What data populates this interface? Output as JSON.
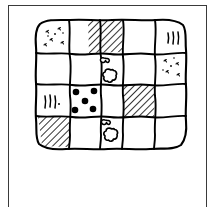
{
  "figure": {
    "title": "Patchwork quilt line drawing",
    "description": "Hand-drawn black ink outline of a square patchwork quilt divided into a 5 by 4 grid of patches, each patch drawn with wobbly freehand lines and filled with a different fabric pattern.",
    "style": "black-and-white line art",
    "stroke_color": "#000000",
    "background_color": "#ffffff",
    "frame": {
      "present": true,
      "shape": "rectangle",
      "color": "#3a3a3a",
      "line_width": 1
    }
  },
  "quilt": {
    "columns": 5,
    "rows": 4,
    "total_patches": 20,
    "patch_outline_color": "#000000",
    "patch_fill_color": "#ffffff",
    "patterns_legend": [
      {
        "key": "plain",
        "label": "plain"
      },
      {
        "key": "hatch",
        "label": "diagonal hatch"
      },
      {
        "key": "speckle",
        "label": "speckled"
      },
      {
        "key": "strokes",
        "label": "short strokes"
      },
      {
        "key": "dots",
        "label": "polka dots"
      },
      {
        "key": "flower",
        "label": "flower"
      }
    ],
    "patches": [
      {
        "row": 1,
        "col": 1,
        "pattern": "speckle"
      },
      {
        "row": 1,
        "col": 2,
        "pattern": "plain"
      },
      {
        "row": 1,
        "col": 3,
        "pattern": "hatch"
      },
      {
        "row": 1,
        "col": 4,
        "pattern": "plain"
      },
      {
        "row": 1,
        "col": 5,
        "pattern": "strokes"
      },
      {
        "row": 2,
        "col": 1,
        "pattern": "plain"
      },
      {
        "row": 2,
        "col": 2,
        "pattern": "plain"
      },
      {
        "row": 2,
        "col": 3,
        "pattern": "flower"
      },
      {
        "row": 2,
        "col": 4,
        "pattern": "plain"
      },
      {
        "row": 2,
        "col": 5,
        "pattern": "speckle"
      },
      {
        "row": 3,
        "col": 1,
        "pattern": "strokes"
      },
      {
        "row": 3,
        "col": 2,
        "pattern": "dots"
      },
      {
        "row": 3,
        "col": 3,
        "pattern": "plain"
      },
      {
        "row": 3,
        "col": 4,
        "pattern": "hatch"
      },
      {
        "row": 3,
        "col": 5,
        "pattern": "plain"
      },
      {
        "row": 4,
        "col": 1,
        "pattern": "hatch"
      },
      {
        "row": 4,
        "col": 2,
        "pattern": "plain"
      },
      {
        "row": 4,
        "col": 3,
        "pattern": "flower"
      },
      {
        "row": 4,
        "col": 4,
        "pattern": "plain"
      },
      {
        "row": 4,
        "col": 5,
        "pattern": "plain"
      }
    ],
    "motif_counts": {
      "hatched_patches": 3,
      "speckled_patches": 2,
      "stroked_patches": 2,
      "dotted_patches": 1,
      "flower_patches": 2,
      "plain_patches": 10
    },
    "dots_patch": {
      "row": 3,
      "col": 2,
      "dot_count": 5,
      "arrangement": "quincunx",
      "dot_color": "#000000"
    }
  }
}
